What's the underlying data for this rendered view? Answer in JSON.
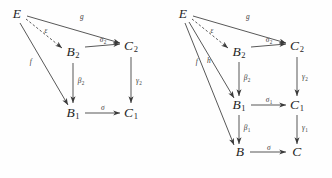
{
  "figure": {
    "background_color": "#fefefe",
    "ink_color": "#2b2b2b",
    "width": 332,
    "height": 178
  },
  "diagrams": [
    {
      "id": "left",
      "name": "commutative-diagram-left",
      "objects": [
        {
          "id": "E",
          "label": "E",
          "sub": "",
          "x": 17,
          "y": 14
        },
        {
          "id": "B2",
          "label": "B",
          "sub": "2",
          "x": 73,
          "y": 52
        },
        {
          "id": "C2",
          "label": "C",
          "sub": "2",
          "x": 131,
          "y": 46
        },
        {
          "id": "B1",
          "label": "B",
          "sub": "1",
          "x": 73,
          "y": 113
        },
        {
          "id": "C1",
          "label": "C",
          "sub": "1",
          "x": 131,
          "y": 113
        }
      ],
      "morphisms": [
        {
          "id": "e",
          "label": "ε",
          "sub": "",
          "from": "E",
          "to": "B2",
          "style": "dashed",
          "x": 46,
          "y": 31
        },
        {
          "id": "g",
          "label": "g",
          "sub": "",
          "from": "E",
          "to": "C2",
          "style": "solid",
          "x": 82,
          "y": 17
        },
        {
          "id": "f",
          "label": "f",
          "sub": "",
          "from": "E",
          "to": "B1",
          "style": "solid",
          "x": 31,
          "y": 62
        },
        {
          "id": "sigma2",
          "label": "σ",
          "sub": "2",
          "from": "B2",
          "to": "C2",
          "style": "solid",
          "x": 103,
          "y": 40
        },
        {
          "id": "beta2",
          "label": "β",
          "sub": "2",
          "from": "B2",
          "to": "B1",
          "style": "solid",
          "x": 81,
          "y": 81
        },
        {
          "id": "gamma2",
          "label": "γ",
          "sub": "2",
          "from": "C2",
          "to": "C1",
          "style": "solid",
          "x": 139,
          "y": 81
        },
        {
          "id": "sigma",
          "label": "σ",
          "sub": "",
          "from": "B1",
          "to": "C1",
          "style": "solid",
          "x": 103,
          "y": 108
        }
      ]
    },
    {
      "id": "right",
      "name": "commutative-diagram-right",
      "objects": [
        {
          "id": "E",
          "label": "E",
          "sub": "",
          "x": 17,
          "y": 14
        },
        {
          "id": "B2",
          "label": "B",
          "sub": "2",
          "x": 73,
          "y": 52
        },
        {
          "id": "C2",
          "label": "C",
          "sub": "2",
          "x": 131,
          "y": 46
        },
        {
          "id": "B1",
          "label": "B",
          "sub": "1",
          "x": 73,
          "y": 105
        },
        {
          "id": "C1",
          "label": "C",
          "sub": "1",
          "x": 131,
          "y": 105
        },
        {
          "id": "B",
          "label": "B",
          "sub": "",
          "x": 74,
          "y": 152
        },
        {
          "id": "C",
          "label": "C",
          "sub": "",
          "x": 131,
          "y": 152
        }
      ],
      "morphisms": [
        {
          "id": "e",
          "label": "ε",
          "sub": "",
          "from": "E",
          "to": "B2",
          "style": "dashed",
          "x": 46,
          "y": 31
        },
        {
          "id": "g",
          "label": "g",
          "sub": "",
          "from": "E",
          "to": "C2",
          "style": "solid",
          "x": 82,
          "y": 17
        },
        {
          "id": "f",
          "label": "f",
          "sub": "",
          "from": "E",
          "to": "B",
          "style": "solid",
          "x": 31,
          "y": 62
        },
        {
          "id": "h",
          "label": "h",
          "sub": "",
          "from": "E",
          "to": "B1",
          "style": "solid",
          "x": 43,
          "y": 61
        },
        {
          "id": "sigma2",
          "label": "σ",
          "sub": "2",
          "from": "B2",
          "to": "C2",
          "style": "solid",
          "x": 103,
          "y": 40
        },
        {
          "id": "beta2",
          "label": "β",
          "sub": "2",
          "from": "B2",
          "to": "B1",
          "style": "solid",
          "x": 81,
          "y": 78
        },
        {
          "id": "gamma2",
          "label": "γ",
          "sub": "2",
          "from": "C2",
          "to": "C1",
          "style": "solid",
          "x": 139,
          "y": 77
        },
        {
          "id": "sigma1",
          "label": "σ",
          "sub": "1",
          "from": "B1",
          "to": "C1",
          "style": "solid",
          "x": 103,
          "y": 100
        },
        {
          "id": "beta1",
          "label": "β",
          "sub": "1",
          "from": "B1",
          "to": "B",
          "style": "solid",
          "x": 81,
          "y": 128
        },
        {
          "id": "gamma1",
          "label": "γ",
          "sub": "1",
          "from": "C1",
          "to": "C",
          "style": "solid",
          "x": 139,
          "y": 128
        },
        {
          "id": "sigma",
          "label": "σ",
          "sub": "",
          "from": "B",
          "to": "C",
          "style": "solid",
          "x": 103,
          "y": 148
        }
      ]
    }
  ]
}
